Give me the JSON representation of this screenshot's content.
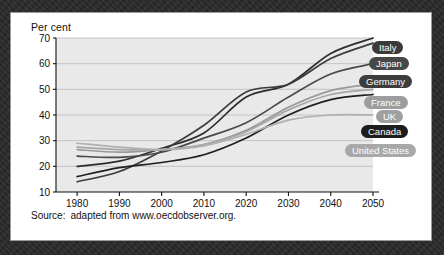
{
  "card": {
    "title": "Per cent",
    "source_label": "Source:",
    "source_text": "adapted from www.oecdobserver.org."
  },
  "chart_data": {
    "type": "line",
    "title": "Per cent",
    "xlabel": "",
    "ylabel": "Per cent",
    "xlim": [
      1975,
      2050
    ],
    "ylim": [
      10,
      70
    ],
    "yticks": [
      10,
      20,
      30,
      40,
      50,
      60,
      70
    ],
    "xticks": [
      1980,
      1990,
      2000,
      2010,
      2020,
      2030,
      2040,
      2050
    ],
    "grid": true,
    "legend_position": "right-inline-labels",
    "x": [
      1980,
      1990,
      2000,
      2010,
      2020,
      2030,
      2040,
      2050
    ],
    "series": [
      {
        "name": "Italy",
        "color": "#2b2b2b",
        "label_color": "#3a3a3a",
        "values": [
          20.0,
          22.0,
          27.0,
          33.0,
          47.0,
          52.0,
          64.0,
          70.0
        ],
        "label_top": 28,
        "label_left": 361
      },
      {
        "name": "Japan",
        "color": "#3c3c3c",
        "label_color": "#474747",
        "values": [
          14.0,
          18.0,
          26.0,
          36.0,
          49.0,
          52.0,
          62.0,
          68.0
        ],
        "label_top": 44,
        "label_left": 358
      },
      {
        "name": "Germany",
        "color": "#4a4a4a",
        "label_color": "#3d3d3d",
        "values": [
          24.0,
          23.5,
          25.5,
          31.0,
          37.0,
          47.0,
          56.0,
          60.0
        ],
        "label_top": 62,
        "label_left": 348
      },
      {
        "name": "France",
        "color": "#9a9a9a",
        "label_color": "#9d9d9d",
        "values": [
          26.5,
          25.5,
          26.5,
          28.5,
          34.0,
          43.0,
          49.5,
          52.0
        ],
        "label_top": 83,
        "label_left": 353
      },
      {
        "name": "UK",
        "color": "#a6a6a6",
        "label_color": "#a0a0a0",
        "values": [
          27.5,
          26.5,
          26.5,
          28.5,
          33.5,
          42.0,
          48.0,
          50.0
        ],
        "label_top": 97,
        "label_left": 365
      },
      {
        "name": "Canada",
        "color": "#1f1f1f",
        "label_color": "#1d1d1d",
        "values": [
          16.0,
          19.5,
          21.5,
          24.5,
          31.0,
          40.0,
          46.0,
          48.0
        ],
        "label_top": 112,
        "label_left": 350
      },
      {
        "name": "United States",
        "color": "#b0b0b0",
        "label_color": "#a8a8a8",
        "values": [
          29.0,
          27.5,
          26.5,
          28.0,
          32.5,
          38.0,
          40.0,
          40.0
        ],
        "label_top": 131,
        "label_left": 334
      }
    ]
  }
}
